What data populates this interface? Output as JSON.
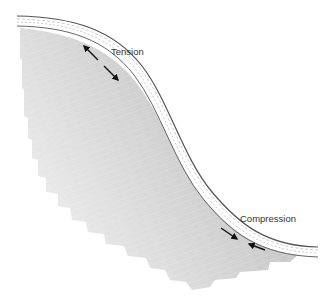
{
  "diagram": {
    "type": "bent-layer-stress",
    "labels": {
      "tension": "Tension",
      "compression": "Compression"
    },
    "colors": {
      "fill_dark": "#b8b8b8",
      "fill_light": "#e4e4e4",
      "beam_line": "#555555",
      "arrow": "#111111",
      "text": "#333333"
    }
  }
}
